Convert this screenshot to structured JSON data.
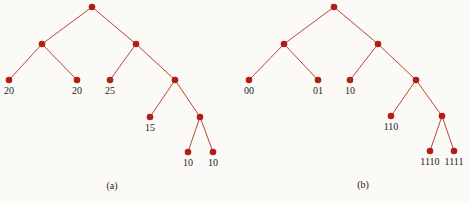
{
  "figure": {
    "trees": [
      {
        "id": "a",
        "caption": "(a)",
        "nodes": [
          {
            "id": "r",
            "label": ""
          },
          {
            "id": "L",
            "label": ""
          },
          {
            "id": "R",
            "label": ""
          },
          {
            "id": "LL",
            "label": "20"
          },
          {
            "id": "LR",
            "label": "20"
          },
          {
            "id": "RL",
            "label": "25"
          },
          {
            "id": "RR",
            "label": ""
          },
          {
            "id": "RRL",
            "label": "15"
          },
          {
            "id": "RRR",
            "label": ""
          },
          {
            "id": "RRRL",
            "label": "10"
          },
          {
            "id": "RRRR",
            "label": "10"
          }
        ],
        "edges": [
          [
            "r",
            "L"
          ],
          [
            "r",
            "R"
          ],
          [
            "L",
            "LL"
          ],
          [
            "L",
            "LR"
          ],
          [
            "R",
            "RL"
          ],
          [
            "R",
            "RR"
          ],
          [
            "RR",
            "RRL"
          ],
          [
            "RR",
            "RRR"
          ],
          [
            "RRR",
            "RRRL"
          ],
          [
            "RRR",
            "RRRR"
          ]
        ]
      },
      {
        "id": "b",
        "caption": "(b)",
        "nodes": [
          {
            "id": "r",
            "label": ""
          },
          {
            "id": "L",
            "label": ""
          },
          {
            "id": "R",
            "label": ""
          },
          {
            "id": "LL",
            "label": "00"
          },
          {
            "id": "LR",
            "label": "01"
          },
          {
            "id": "RL",
            "label": "10"
          },
          {
            "id": "RR",
            "label": ""
          },
          {
            "id": "RRL",
            "label": "110"
          },
          {
            "id": "RRR",
            "label": ""
          },
          {
            "id": "RRRL",
            "label": "1110"
          },
          {
            "id": "RRRR",
            "label": "1111"
          }
        ],
        "edges": [
          [
            "r",
            "L"
          ],
          [
            "r",
            "R"
          ],
          [
            "L",
            "LL"
          ],
          [
            "L",
            "LR"
          ],
          [
            "R",
            "RL"
          ],
          [
            "R",
            "RR"
          ],
          [
            "RR",
            "RRL"
          ],
          [
            "RR",
            "RRR"
          ],
          [
            "RRR",
            "RRRL"
          ],
          [
            "RRR",
            "RRRR"
          ]
        ]
      }
    ],
    "colors": {
      "node": "#b01e16",
      "edge": "#b8453a"
    }
  }
}
